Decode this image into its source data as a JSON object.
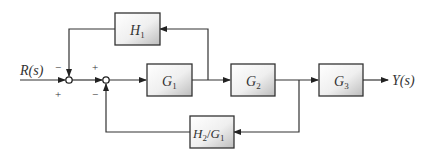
{
  "diagram": {
    "type": "block-diagram",
    "input": {
      "label": "R(s)",
      "main": "R",
      "arg": "(s)"
    },
    "output": {
      "label": "Y(s)",
      "main": "Y",
      "arg": "(s)"
    },
    "blocks": [
      {
        "id": "H1",
        "base": "H",
        "sub": "1"
      },
      {
        "id": "G1",
        "base": "G",
        "sub": "1"
      },
      {
        "id": "G2",
        "base": "G",
        "sub": "2"
      },
      {
        "id": "G3",
        "base": "G",
        "sub": "3"
      },
      {
        "id": "H2_over_G1",
        "base1": "H",
        "sub1": "2",
        "slash": "/",
        "base2": "G",
        "sub2": "1"
      }
    ],
    "summing_junctions": [
      {
        "id": "S1",
        "signs": {
          "top": "−",
          "left_bottom": "+"
        }
      },
      {
        "id": "S2",
        "signs": {
          "left_top": "+",
          "bottom": "−"
        }
      }
    ],
    "colors": {
      "line": "#333333",
      "block_border": "#333333",
      "block_fill_light": "#ffffff",
      "block_fill_dark": "#c8c8c8"
    }
  }
}
